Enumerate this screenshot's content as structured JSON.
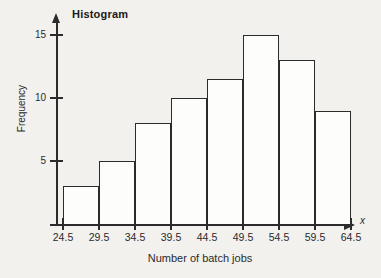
{
  "chart_data": {
    "type": "bar",
    "title": "Histogram",
    "xlabel": "Number of batch jobs",
    "ylabel": "Frequency",
    "x_axis_symbol": "x",
    "bin_edges": [
      "24.5",
      "29.5",
      "34.5",
      "39.5",
      "44.5",
      "49.5",
      "54.5",
      "59.5",
      "64.5"
    ],
    "categories": [
      "24.5-29.5",
      "29.5-34.5",
      "34.5-39.5",
      "39.5-44.5",
      "44.5-49.5",
      "49.5-54.5",
      "54.5-59.5",
      "59.5-64.5"
    ],
    "values": [
      3,
      5,
      8,
      10,
      11.5,
      15,
      13,
      9
    ],
    "ytick_labels": [
      "5",
      "10",
      "15"
    ],
    "ytick_values": [
      5,
      10,
      15
    ],
    "ylim": [
      0,
      16.5
    ],
    "xlim": [
      "24.5",
      "64.5"
    ],
    "grid": false,
    "legend": null,
    "bar_fill_color": "#fdfdfc",
    "bar_edge_color": "#2b2b2b",
    "background_color": "#f2f1ee"
  }
}
